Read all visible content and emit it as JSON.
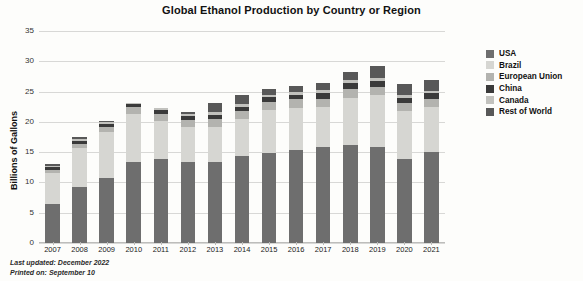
{
  "chart_data": {
    "type": "bar",
    "subtype": "stacked-column",
    "title": "Global Ethanol Production by Country or Region",
    "xlabel": "",
    "ylabel": "Billions of Gallons",
    "ylim": [
      0,
      35
    ],
    "ytick_step": 5,
    "yticks": [
      "0",
      "5",
      "10",
      "15",
      "20",
      "25",
      "30",
      "35"
    ],
    "grid": true,
    "legend_position": "right",
    "categories": [
      "2007",
      "2008",
      "2009",
      "2010",
      "2011",
      "2012",
      "2013",
      "2014",
      "2015",
      "2016",
      "2017",
      "2018",
      "2019",
      "2020",
      "2021"
    ],
    "series": [
      {
        "name": "USA",
        "color": "#6e6e6e",
        "values": [
          6.5,
          9.2,
          10.8,
          13.3,
          13.9,
          13.3,
          13.3,
          14.3,
          14.8,
          15.3,
          15.8,
          16.1,
          15.8,
          13.9,
          15.0
        ]
      },
      {
        "name": "Brazil",
        "color": "#d6d6d2",
        "values": [
          5.0,
          6.5,
          7.5,
          8.0,
          6.3,
          5.8,
          5.8,
          6.1,
          7.1,
          7.0,
          6.6,
          7.9,
          8.6,
          7.9,
          7.5
        ]
      },
      {
        "name": "European Union",
        "color": "#b3b3af",
        "values": [
          0.6,
          0.7,
          0.9,
          1.1,
          1.1,
          1.2,
          1.4,
          1.4,
          1.4,
          1.4,
          1.4,
          1.4,
          1.4,
          1.3,
          1.3
        ]
      },
      {
        "name": "China",
        "color": "#3a3a3a",
        "values": [
          0.5,
          0.5,
          0.5,
          0.5,
          0.6,
          0.6,
          0.6,
          0.6,
          0.8,
          0.8,
          0.9,
          1.0,
          1.0,
          0.9,
          0.9
        ]
      },
      {
        "name": "Canada",
        "color": "#c2c2be",
        "values": [
          0.2,
          0.2,
          0.3,
          0.3,
          0.4,
          0.4,
          0.5,
          0.5,
          0.4,
          0.4,
          0.5,
          0.5,
          0.5,
          0.4,
          0.4
        ]
      },
      {
        "name": "Rest of World",
        "color": "#585858",
        "values": [
          0.2,
          0.4,
          0.2,
          0.0,
          0.0,
          0.4,
          1.6,
          1.5,
          1.0,
          1.0,
          1.3,
          1.4,
          1.9,
          1.8,
          1.9
        ]
      }
    ],
    "totals": [
      13.0,
      17.5,
      20.2,
      23.2,
      22.3,
      21.7,
      23.2,
      24.4,
      25.5,
      25.9,
      26.5,
      28.3,
      29.2,
      26.2,
      27.0
    ]
  },
  "footnote": {
    "line1": "Last updated: December 2022",
    "line2": "Printed on: September 10"
  }
}
